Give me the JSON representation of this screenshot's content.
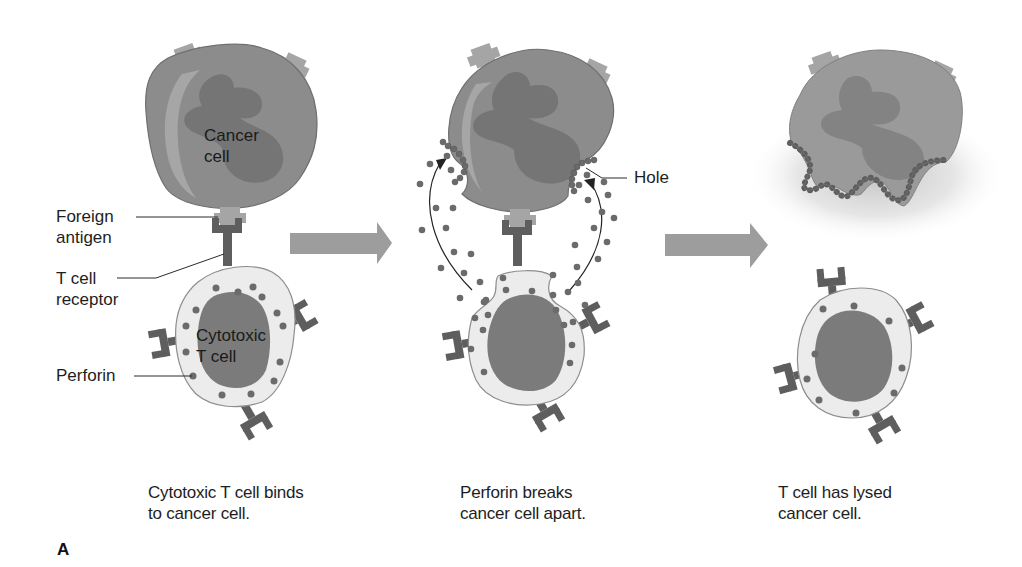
{
  "figure": {
    "panel_letter": "A",
    "colors": {
      "background": "#ffffff",
      "cancer_cell_body": "#8a8a8a",
      "cancer_cell_nucleus": "#707070",
      "cancer_cell_highlight": "#a9a9a9",
      "antigen": "#a3a3a3",
      "receptor": "#5e5e5e",
      "t_cell_cytoplasm": "#ececec",
      "t_cell_nucleus": "#7a7a7a",
      "perforin_dot": "#6b6b6b",
      "arrow": "#9c9c9c",
      "leader_line": "#2a2a2a"
    },
    "stages": [
      {
        "id": "stage-1",
        "labels": {
          "cancer_cell": "Cancer\ncell",
          "cancer_cell_line1": "Cancer",
          "cancer_cell_line2": "cell",
          "foreign_antigen_line1": "Foreign",
          "foreign_antigen_line2": "antigen",
          "t_cell_receptor_line1": "T cell",
          "t_cell_receptor_line2": "receptor",
          "cytotoxic_line1": "Cytotoxic",
          "cytotoxic_line2": "T cell",
          "perforin": "Perforin"
        },
        "caption_line1": "Cytotoxic T cell binds",
        "caption_line2": "to cancer cell."
      },
      {
        "id": "stage-2",
        "labels": {
          "hole": "Hole"
        },
        "caption_line1": "Perforin breaks",
        "caption_line2": "cancer cell apart."
      },
      {
        "id": "stage-3",
        "labels": {},
        "caption_line1": "T cell has lysed",
        "caption_line2": "cancer cell."
      }
    ],
    "arrows": [
      {
        "id": "arrow-1",
        "direction": "right"
      },
      {
        "id": "arrow-2",
        "direction": "right"
      }
    ]
  }
}
